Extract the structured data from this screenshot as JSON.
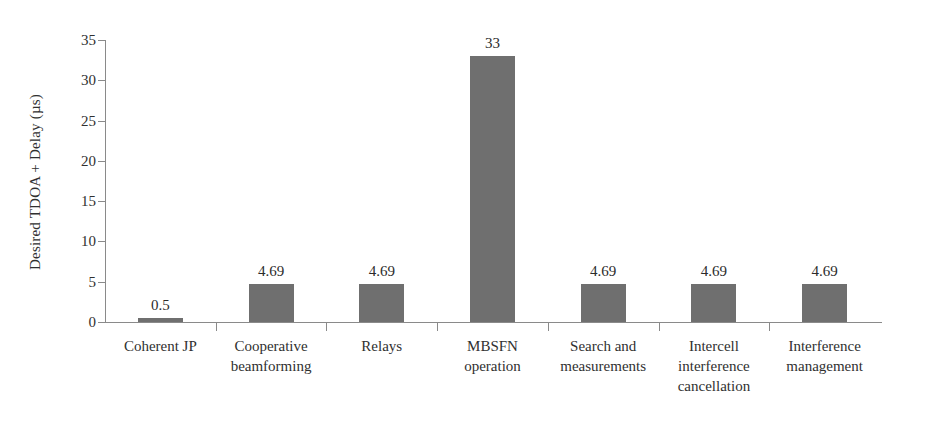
{
  "chart_data": {
    "type": "bar",
    "title": "",
    "xlabel": "",
    "ylabel": "Desired TDOA + Delay (µs)",
    "categories": [
      "Coherent JP",
      "Cooperative beamforming",
      "Relays",
      "MBSFN operation",
      "Search and measurements",
      "Intercell interference cancellation",
      "Interference management"
    ],
    "category_lines": [
      [
        "Coherent JP"
      ],
      [
        "Cooperative",
        "beamforming"
      ],
      [
        "Relays"
      ],
      [
        "MBSFN",
        "operation"
      ],
      [
        "Search and",
        "measurements"
      ],
      [
        "Intercell",
        "interference",
        "cancellation"
      ],
      [
        "Interference",
        "management"
      ]
    ],
    "values": [
      0.5,
      4.69,
      4.69,
      33,
      4.69,
      4.69,
      4.69
    ],
    "value_labels": [
      "0.5",
      "4.69",
      "4.69",
      "33",
      "4.69",
      "4.69",
      "4.69"
    ],
    "ylim": [
      0,
      35
    ],
    "ytick_labels": [
      "0",
      "5",
      "10",
      "15",
      "20",
      "25",
      "30",
      "35"
    ],
    "ytick_values": [
      0,
      5,
      10,
      15,
      20,
      25,
      30,
      35
    ],
    "grid": false,
    "legend": false,
    "legend_position": "none",
    "bar_color": "#6f6f6f",
    "axis_color": "#8a8a8a",
    "text_color": "#303030",
    "background_color": "#ffffff"
  }
}
